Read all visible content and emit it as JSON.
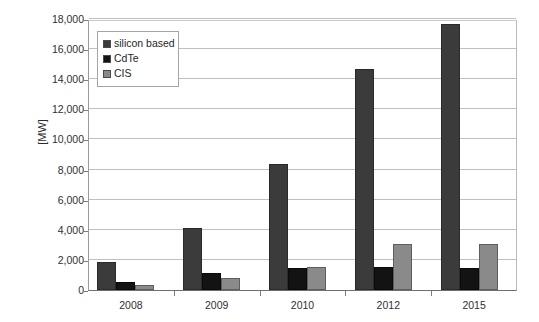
{
  "chart_data": {
    "type": "bar",
    "title": "",
    "xlabel": "",
    "ylabel": "[MW]",
    "categories": [
      "2008",
      "2009",
      "2010",
      "2012",
      "2015"
    ],
    "series": [
      {
        "name": "silicon based",
        "color": "#3b3b3b",
        "values": [
          1850,
          4150,
          8400,
          14700,
          17650
        ]
      },
      {
        "name": "CdTe",
        "color": "#131313",
        "values": [
          550,
          1150,
          1450,
          1500,
          1480
        ]
      },
      {
        "name": "CIS",
        "color": "#8a8a8a",
        "values": [
          350,
          800,
          1550,
          3050,
          3040
        ]
      }
    ],
    "ylim": [
      0,
      18000
    ],
    "ytick_step": 2000,
    "ytick_labels": [
      "0",
      "2,000",
      "4,000",
      "6,000",
      "8,000",
      "10,000",
      "12,000",
      "14,000",
      "16,000",
      "18,000"
    ],
    "ytick_values": [
      0,
      2000,
      4000,
      6000,
      8000,
      10000,
      12000,
      14000,
      16000,
      18000
    ],
    "grid": true,
    "legend_position": "top-left-inside",
    "background_color": "#ffffff",
    "grid_color": "#bfbfbf",
    "axis_color": "#6f6f6f"
  }
}
